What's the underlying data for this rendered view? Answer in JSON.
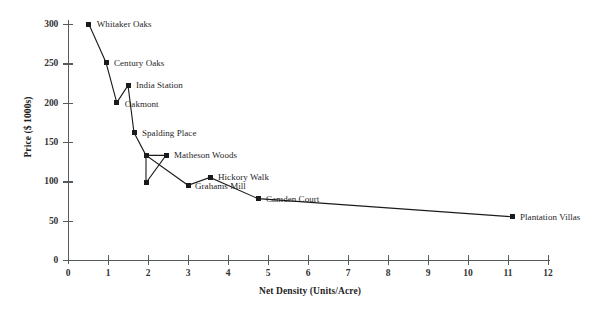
{
  "chart_data": {
    "type": "line",
    "title": "",
    "xlabel": "Net Density (Units/Acre)",
    "ylabel": "Price ($ 1000s)",
    "xlim": [
      0,
      12
    ],
    "ylim": [
      0,
      300
    ],
    "xticks": [
      0,
      1,
      2,
      3,
      4,
      5,
      6,
      7,
      8,
      9,
      10,
      11,
      12
    ],
    "yticks": [
      0,
      50,
      100,
      150,
      200,
      250,
      300
    ],
    "grid": false,
    "legend": "none",
    "marker": "square",
    "line_color": "#1b1b1b",
    "marker_color": "#1b1b1b",
    "points": [
      {
        "label": "Whitaker Oaks",
        "x": 0.52,
        "y": 300,
        "label_dx": 8,
        "label_dy": -5
      },
      {
        "label": "Century Oaks",
        "x": 0.95,
        "y": 251,
        "label_dx": 8,
        "label_dy": -5
      },
      {
        "label": "India Station",
        "x": 1.5,
        "y": 222,
        "label_dx": 8,
        "label_dy": -5
      },
      {
        "label": "Oakmont",
        "x": 1.22,
        "y": 200,
        "label_dx": 8,
        "label_dy": -4
      },
      {
        "label": "Spalding Place",
        "x": 1.65,
        "y": 162,
        "label_dx": 8,
        "label_dy": -5
      },
      {
        "label": "",
        "x": 1.95,
        "y": 133,
        "label_dx": 0,
        "label_dy": 0
      },
      {
        "label": "Matheson Woods",
        "x": 2.45,
        "y": 133,
        "label_dx": 8,
        "label_dy": -5
      },
      {
        "label": "",
        "x": 1.95,
        "y": 98,
        "label_dx": 0,
        "label_dy": 0
      },
      {
        "label": "Grahams Mill",
        "x": 3.0,
        "y": 95,
        "label_dx": 7,
        "label_dy": -4
      },
      {
        "label": "Hickory Walk",
        "x": 3.55,
        "y": 105,
        "label_dx": 8,
        "label_dy": -5
      },
      {
        "label": "Camden Court",
        "x": 4.75,
        "y": 78,
        "label_dx": 8,
        "label_dy": -5
      },
      {
        "label": "Plantation Villas",
        "x": 11.1,
        "y": 55,
        "label_dx": 8,
        "label_dy": -5
      }
    ],
    "path_order": [
      0,
      1,
      3,
      2,
      4,
      5,
      6,
      7,
      5,
      8,
      9,
      10,
      11
    ]
  }
}
